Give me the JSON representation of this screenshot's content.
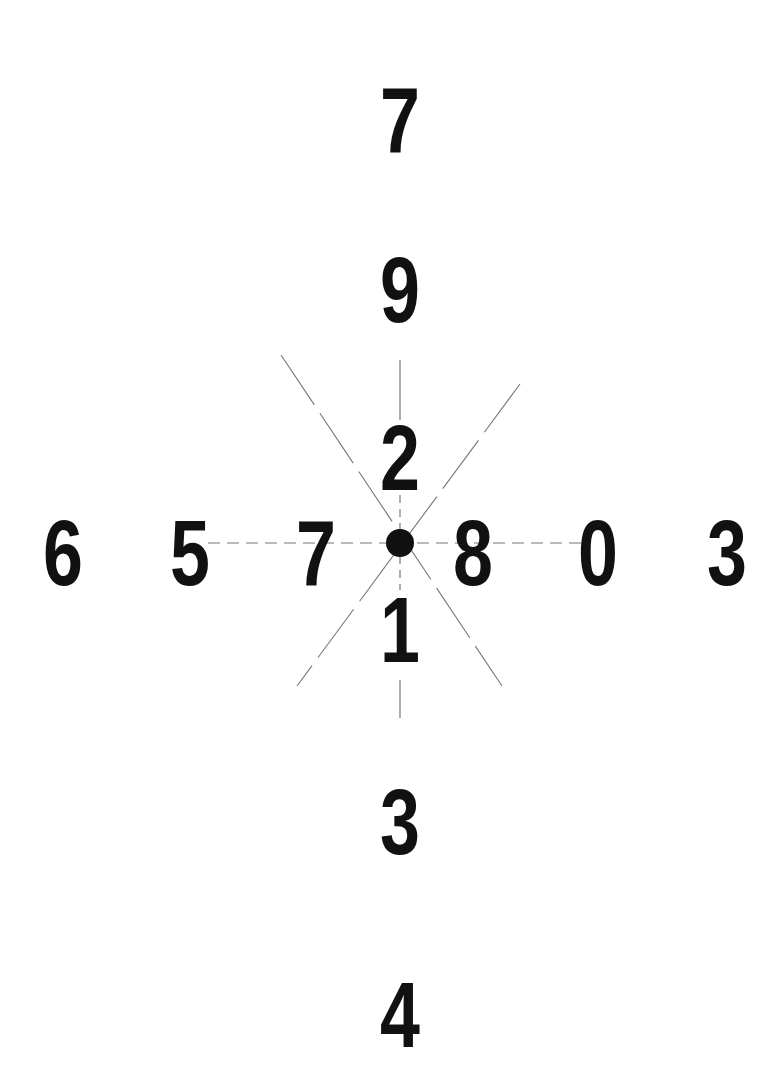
{
  "chart": {
    "type": "fixation-digit-cross",
    "fixation_dot": {
      "x": 400,
      "y": 543
    },
    "colors": {
      "digits": "#111111",
      "lines": "#777777",
      "background": "#ffffff"
    },
    "vertical_digits": [
      {
        "label": "7",
        "x": 400,
        "y": 120
      },
      {
        "label": "9",
        "x": 400,
        "y": 290
      },
      {
        "label": "2",
        "x": 400,
        "y": 458
      },
      {
        "label": "1",
        "x": 400,
        "y": 630
      },
      {
        "label": "3",
        "x": 400,
        "y": 822
      },
      {
        "label": "4",
        "x": 400,
        "y": 1015
      }
    ],
    "horizontal_digits": [
      {
        "label": "6",
        "x": 63,
        "y": 553
      },
      {
        "label": "5",
        "x": 190,
        "y": 553
      },
      {
        "label": "7",
        "x": 316,
        "y": 553
      },
      {
        "label": "8",
        "x": 473,
        "y": 553
      },
      {
        "label": "0",
        "x": 598,
        "y": 553
      },
      {
        "label": "3",
        "x": 727,
        "y": 553
      }
    ]
  }
}
